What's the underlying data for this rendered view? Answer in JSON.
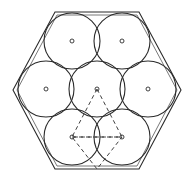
{
  "figure": {
    "caption": "",
    "width": 195,
    "height": 179,
    "background_color": "#ffffff",
    "stroke_color": "#2b2b2b",
    "inner_stroke_color": "#555555",
    "dash_pattern": "4 3"
  },
  "chart_data": {
    "type": "diagram",
    "xlabel": "",
    "ylabel": "",
    "grid": false,
    "legend": "none",
    "xlim": [
      0,
      195
    ],
    "ylim": [
      0,
      179
    ],
    "hexagon": {
      "name": "bounding-hexagon",
      "orientation": "flat-top",
      "center": [
        97,
        90
      ],
      "circumradius": 84,
      "vertices": [
        [
          55,
          12
        ],
        [
          139,
          12
        ],
        [
          181,
          90
        ],
        [
          139,
          169
        ],
        [
          55,
          169
        ],
        [
          13,
          90
        ]
      ]
    },
    "hexagon_inner": {
      "name": "bounding-hexagon-inner",
      "center": [
        97,
        90
      ],
      "circumradius": 80,
      "vertices": [
        [
          57,
          15
        ],
        [
          137,
          15
        ],
        [
          177,
          90
        ],
        [
          137,
          166
        ],
        [
          57,
          166
        ],
        [
          17,
          90
        ]
      ]
    },
    "circle_radius": 28,
    "circles": [
      {
        "id": "circle-top-left",
        "label": "top-left",
        "cx": 72,
        "cy": 41,
        "r": 28
      },
      {
        "id": "circle-top-right",
        "label": "top-right",
        "cx": 122,
        "cy": 41,
        "r": 28
      },
      {
        "id": "circle-middle-left",
        "label": "middle-left",
        "cx": 46,
        "cy": 89,
        "r": 28
      },
      {
        "id": "circle-center",
        "label": "center",
        "cx": 97,
        "cy": 89,
        "r": 28
      },
      {
        "id": "circle-middle-right",
        "label": "middle-right",
        "cx": 148,
        "cy": 89,
        "r": 28
      },
      {
        "id": "circle-bottom-left",
        "label": "bottom-left",
        "cx": 72,
        "cy": 137,
        "r": 28
      },
      {
        "id": "circle-bottom-right",
        "label": "bottom-right",
        "cx": 122,
        "cy": 137,
        "r": 28
      }
    ],
    "center_dots": [
      {
        "id": "dot-top-left",
        "cx": 72,
        "cy": 41,
        "r": 2
      },
      {
        "id": "dot-top-right",
        "cx": 122,
        "cy": 41,
        "r": 2
      },
      {
        "id": "dot-middle-left",
        "cx": 46,
        "cy": 89,
        "r": 2
      },
      {
        "id": "dot-center",
        "cx": 97,
        "cy": 89,
        "r": 2
      },
      {
        "id": "dot-middle-right",
        "cx": 148,
        "cy": 89,
        "r": 2
      },
      {
        "id": "dot-bottom-left",
        "cx": 72,
        "cy": 137,
        "r": 2
      },
      {
        "id": "dot-bottom-right",
        "cx": 122,
        "cy": 137,
        "r": 2
      }
    ],
    "dashed_triangles": [
      {
        "id": "triangle-upper",
        "label": "upper-dashed-triangle",
        "points": [
          [
            97,
            89
          ],
          [
            72,
            137
          ],
          [
            122,
            137
          ]
        ]
      },
      {
        "id": "triangle-lower",
        "label": "lower-dashed-triangle",
        "points": [
          [
            72,
            137
          ],
          [
            122,
            137
          ],
          [
            97,
            169
          ]
        ]
      }
    ],
    "annotations": []
  }
}
